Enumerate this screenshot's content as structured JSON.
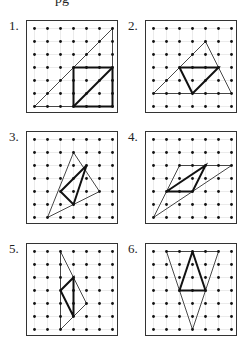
{
  "header": {
    "partial_text": "pg"
  },
  "grid": {
    "cols": 7,
    "rows": 7,
    "spacing": 13,
    "inset": 7.5
  },
  "colors": {
    "dot": "#111111",
    "gridline": "#dddddd",
    "thin": "#333333",
    "bold": "#111111"
  },
  "panels": [
    {
      "label": "1.",
      "x": 26,
      "y": 20,
      "thin": [
        [
          0,
          6
        ],
        [
          6,
          0
        ],
        [
          6,
          6
        ]
      ],
      "bold": [
        [
          [
            3,
            3
          ],
          [
            6,
            3
          ],
          [
            6,
            6
          ],
          [
            3,
            6
          ],
          [
            3,
            3
          ]
        ],
        [
          [
            3,
            6
          ],
          [
            6,
            3
          ]
        ]
      ]
    },
    {
      "label": "2.",
      "x": 145,
      "y": 20,
      "thin": [
        [
          0,
          5
        ],
        [
          4,
          1
        ],
        [
          6,
          5
        ]
      ],
      "bold": [
        [
          [
            2,
            3
          ],
          [
            5,
            3
          ],
          [
            3,
            5
          ],
          [
            2,
            3
          ]
        ]
      ]
    },
    {
      "label": "3.",
      "x": 26,
      "y": 131,
      "thin": [
        [
          3,
          1
        ],
        [
          5,
          4
        ],
        [
          1,
          6
        ]
      ],
      "bold": [
        [
          [
            2,
            4
          ],
          [
            4,
            2
          ],
          [
            3,
            5
          ],
          [
            2,
            4
          ]
        ]
      ]
    },
    {
      "label": "4.",
      "x": 145,
      "y": 131,
      "thin": [
        [
          2,
          2
        ],
        [
          6,
          2
        ],
        [
          0,
          6
        ]
      ],
      "bold": [
        [
          [
            1,
            4
          ],
          [
            3,
            4
          ],
          [
            4,
            2
          ],
          [
            1,
            4
          ]
        ]
      ]
    },
    {
      "label": "5.",
      "x": 26,
      "y": 243,
      "thin": [
        [
          2,
          0
        ],
        [
          4,
          4
        ],
        [
          2,
          6
        ]
      ],
      "bold": [
        [
          [
            2,
            3
          ],
          [
            3,
            2
          ],
          [
            3,
            5
          ],
          [
            2,
            3
          ]
        ]
      ]
    },
    {
      "label": "6.",
      "x": 145,
      "y": 243,
      "thin": [
        [
          1,
          0
        ],
        [
          5,
          0
        ],
        [
          3,
          6
        ]
      ],
      "bold": [
        [
          [
            3,
            0
          ],
          [
            4,
            3
          ],
          [
            2,
            3
          ],
          [
            3,
            0
          ]
        ]
      ]
    }
  ]
}
